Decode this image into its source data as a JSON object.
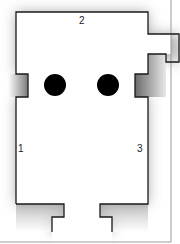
{
  "diagram": {
    "type": "floor-plan",
    "labels": [
      {
        "id": "wall-1",
        "text": "1"
      },
      {
        "id": "wall-2",
        "text": "2"
      },
      {
        "id": "wall-3",
        "text": "3"
      }
    ],
    "columns": 2,
    "colors": {
      "wall": "#1a1a1a",
      "shadow": "#8a8a8a",
      "column": "#000000",
      "frame": "#9a9a9a"
    }
  }
}
